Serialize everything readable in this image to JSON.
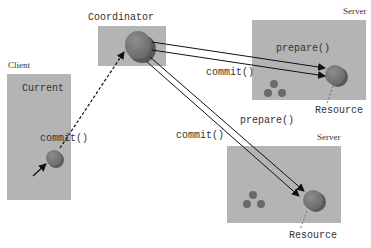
{
  "diagram": {
    "nodes": {
      "client": {
        "caption": "Client",
        "label": "Current"
      },
      "coordinator": {
        "label": "Coordinator"
      },
      "server_top": {
        "caption": "Server",
        "resource_label": "Resource"
      },
      "server_bottom": {
        "caption": "Server",
        "resource_label": "Resource"
      }
    },
    "edges": {
      "client_commit": "commit()",
      "to_server_top_prepare": "prepare()",
      "to_server_top_commit": "commit()",
      "to_server_bottom_prepare": "prepare()",
      "to_server_bottom_commit": "commit()"
    },
    "colors": {
      "box": "#b4b4b4",
      "sphere": "#7a7a7a",
      "arrow": "#111111"
    }
  }
}
